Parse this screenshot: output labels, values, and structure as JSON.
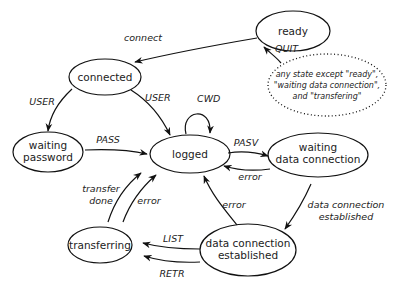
{
  "diagram": {
    "type": "state-machine",
    "nodes": {
      "ready": {
        "lines": [
          "ready"
        ]
      },
      "connected": {
        "lines": [
          "connected"
        ]
      },
      "waiting_password": {
        "lines": [
          "waiting",
          "password"
        ]
      },
      "logged": {
        "lines": [
          "logged"
        ]
      },
      "waiting_data_connection": {
        "lines": [
          "waiting",
          "data connection"
        ]
      },
      "transferring": {
        "lines": [
          "transferring"
        ]
      },
      "data_connection_established": {
        "lines": [
          "data connection",
          "established"
        ]
      }
    },
    "note": {
      "lines": [
        "any state except \"ready\",",
        "\"waiting data connection\",",
        "and \"transfering\""
      ]
    },
    "edges": {
      "connect": "connect",
      "quit": "QUIT",
      "user_to_waiting": "USER",
      "user_to_logged": "USER",
      "cwd": "CWD",
      "pass": "PASS",
      "pasv": "PASV",
      "error_wdc": "error",
      "data_conn_established": [
        "data connection",
        "established"
      ],
      "error_dce": "error",
      "list": "LIST",
      "retr": "RETR",
      "transfer_done": [
        "transfer",
        "done"
      ],
      "error_transfer": "error"
    }
  }
}
